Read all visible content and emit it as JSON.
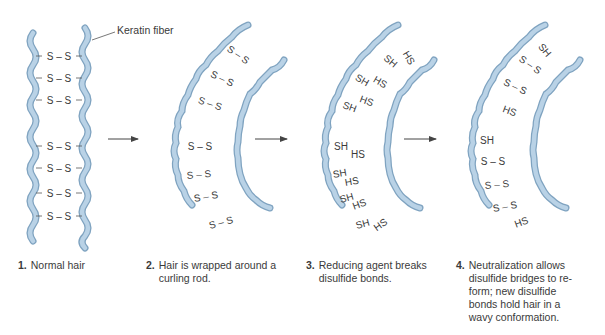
{
  "colors": {
    "fiber_fill": "#b9d2e6",
    "fiber_stroke": "#7fa3c0",
    "text": "#3a3a3a",
    "arrow": "#444444"
  },
  "labels": {
    "keratin_fiber": "Keratin fiber"
  },
  "steps": [
    {
      "number": "1.",
      "caption": "Normal hair",
      "bonds": [
        "S – S",
        "S – S",
        "S – S",
        "S – S",
        "S – S",
        "S – S",
        "S – S"
      ]
    },
    {
      "number": "2.",
      "caption": "Hair is wrapped around a curling rod.",
      "bonds": [
        "S – S",
        "S – S",
        "S – S",
        "S – S",
        "S – S",
        "S – S",
        "S – S"
      ]
    },
    {
      "number": "3.",
      "caption": "Reducing agent breaks disulfide bonds.",
      "left_groups": [
        "SH",
        "SH",
        "SH",
        "SH",
        "SH",
        "SH",
        "SH"
      ],
      "right_groups": [
        "HS",
        "HS",
        "HS",
        "HS",
        "HS",
        "HS",
        "HS"
      ]
    },
    {
      "number": "4.",
      "caption": "Neutralization allows disulfide bridges to re-form; new disulfide bonds hold hair in a wavy conformation.",
      "bonds": [
        "SH",
        "S – S",
        "S – S",
        "HS",
        "SH",
        "S – S",
        "S – S",
        "S – S",
        "HS"
      ]
    }
  ],
  "arrows": [
    "arrow-1-to-2",
    "arrow-2-to-3",
    "arrow-3-to-4"
  ]
}
